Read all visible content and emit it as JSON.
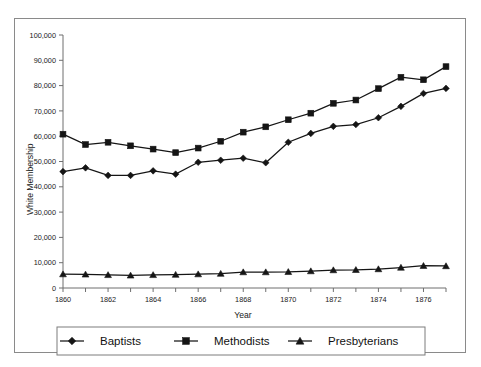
{
  "chart_data": {
    "type": "line",
    "title": "",
    "xlabel": "Year",
    "ylabel": "White Membership",
    "xlim": [
      1860,
      1877
    ],
    "ylim": [
      0,
      100000
    ],
    "grid": false,
    "legend_position": "bottom",
    "x": [
      1860,
      1861,
      1862,
      1863,
      1864,
      1865,
      1866,
      1867,
      1868,
      1869,
      1870,
      1871,
      1872,
      1873,
      1874,
      1875,
      1876,
      1877
    ],
    "x_tick_labels": [
      "1860",
      "1862",
      "1864",
      "1866",
      "1868",
      "1870",
      "1872",
      "1874",
      "1876"
    ],
    "x_tick_values": [
      1860,
      1862,
      1864,
      1866,
      1868,
      1870,
      1872,
      1874,
      1876
    ],
    "y_tick_labels": [
      "0",
      "10,000",
      "20,000",
      "30,000",
      "40,000",
      "50,000",
      "60,000",
      "70,000",
      "80,000",
      "90,000",
      "100,000"
    ],
    "y_tick_values": [
      0,
      10000,
      20000,
      30000,
      40000,
      50000,
      60000,
      70000,
      80000,
      90000,
      100000
    ],
    "series": [
      {
        "name": "Baptists",
        "marker": "diamond",
        "color": "#151515",
        "values": [
          46000,
          47500,
          44500,
          44500,
          46300,
          45000,
          49700,
          50500,
          51300,
          49500,
          57600,
          61100,
          63900,
          64600,
          67300,
          71800,
          76900,
          78900
        ]
      },
      {
        "name": "Methodists",
        "marker": "square",
        "color": "#151515",
        "values": [
          60800,
          56700,
          57600,
          56200,
          54900,
          53500,
          55300,
          58000,
          61600,
          63700,
          66500,
          69100,
          73000,
          74300,
          78800,
          83300,
          82300,
          87500
        ]
      },
      {
        "name": "Presbyterians",
        "marker": "triangle",
        "color": "#151515",
        "values": [
          5500,
          5400,
          5200,
          5000,
          5200,
          5300,
          5500,
          5700,
          6300,
          6300,
          6400,
          6700,
          7100,
          7200,
          7500,
          8100,
          8800,
          8700
        ]
      }
    ]
  },
  "legend": {
    "items": [
      {
        "label": "Baptists",
        "marker": "diamond"
      },
      {
        "label": "Methodists",
        "marker": "square"
      },
      {
        "label": "Presbyterians",
        "marker": "triangle"
      }
    ]
  },
  "colors": {
    "ink": "#151515",
    "axis": "#6f6f6f",
    "frame": "#8a8a8a",
    "background": "#ffffff"
  }
}
